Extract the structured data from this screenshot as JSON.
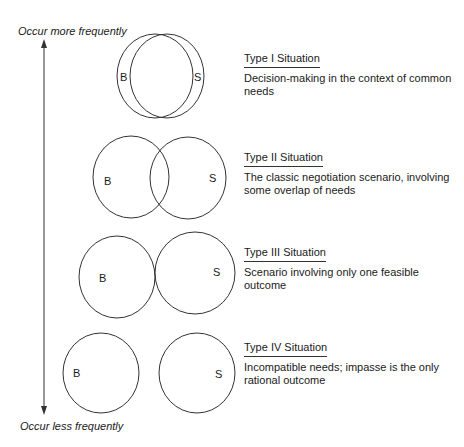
{
  "axis": {
    "top_label": "Occur more frequently",
    "bottom_label": "Occur less frequently"
  },
  "situations": [
    {
      "title": "Type I Situation",
      "description_lines": [
        "Decision-making in the context of common",
        "needs"
      ],
      "left_label": "B",
      "right_label": "S",
      "relation": "near-complete overlap"
    },
    {
      "title": "Type II Situation",
      "description_lines": [
        "The classic negotiation scenario, involving",
        "some overlap of needs"
      ],
      "left_label": "B",
      "right_label": "S",
      "relation": "partial overlap"
    },
    {
      "title": "Type III Situation",
      "description_lines": [
        "Scenario involving only one feasible",
        "outcome"
      ],
      "left_label": "B",
      "right_label": "S",
      "relation": "touching at one point"
    },
    {
      "title": "Type IV Situation",
      "description_lines": [
        "Incompatible needs; impasse is the only",
        "rational outcome"
      ],
      "left_label": "B",
      "right_label": "S",
      "relation": "separate"
    }
  ],
  "colors": {
    "line": "#333333",
    "text": "#1a1a1a",
    "background": "#ffffff"
  }
}
